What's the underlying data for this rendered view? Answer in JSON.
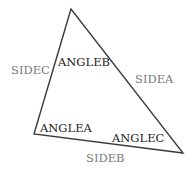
{
  "diagram": {
    "type": "triangle",
    "vertices": {
      "top": [
        71,
        9
      ],
      "bottom_left": [
        34,
        134
      ],
      "bottom_right": [
        183,
        153
      ]
    },
    "stroke_color": "#3a3a3a",
    "side_label_color": "#7a7a7a",
    "angle_label_color": "#1e1e1e",
    "labels": {
      "side_a": "SIDEA",
      "side_b": "SIDEB",
      "side_c": "SIDEC",
      "angle_a": "ANGLEA",
      "angle_b": "ANGLEB",
      "angle_c": "ANGLEC"
    }
  }
}
